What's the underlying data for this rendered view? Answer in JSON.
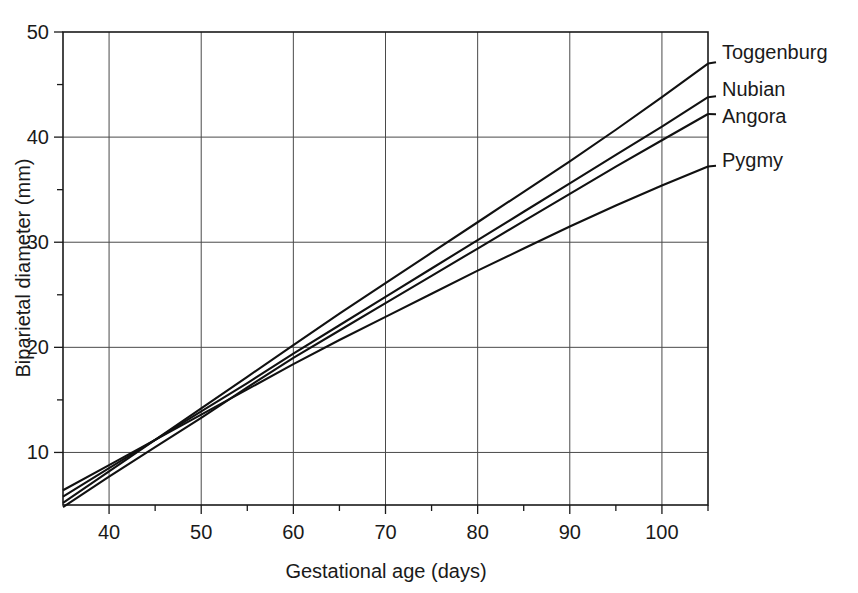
{
  "chart_data": {
    "type": "line",
    "title": "",
    "subtitle": "",
    "xlabel": "Gestational age (days)",
    "ylabel": "Biparietal diameter (mm)",
    "xlim": [
      35,
      105
    ],
    "ylim": [
      5,
      50
    ],
    "grid": true,
    "legend_position": "right-inline-labels",
    "x_major_ticks": [
      40,
      50,
      60,
      70,
      80,
      90,
      100
    ],
    "x_major_ticklabels": [
      "40",
      "50",
      "60",
      "70",
      "80",
      "90",
      "100"
    ],
    "x_minor_ticks": [
      45,
      55,
      65,
      75,
      85,
      95,
      105
    ],
    "y_major_ticks": [
      10,
      20,
      30,
      40,
      50
    ],
    "y_major_ticklabels": [
      "10",
      "20",
      "30",
      "40",
      "50"
    ],
    "y_minor_ticks": [
      15,
      25,
      35,
      45
    ],
    "x": [
      35,
      40,
      45,
      50,
      55,
      60,
      65,
      70,
      75,
      80,
      85,
      90,
      95,
      100,
      105
    ],
    "series": [
      {
        "name": "Toggenburg",
        "label": "Toggenburg",
        "color": "#111111",
        "values": [
          5.2,
          8.2,
          11.2,
          14.2,
          17.2,
          20.2,
          23.2,
          26.1,
          29.0,
          31.9,
          34.8,
          37.7,
          40.7,
          43.8,
          47.0
        ]
      },
      {
        "name": "Nubian",
        "label": "Nubian",
        "color": "#111111",
        "values": [
          5.8,
          8.5,
          11.2,
          13.9,
          16.6,
          19.4,
          22.1,
          24.8,
          27.5,
          30.2,
          32.9,
          35.6,
          38.3,
          41.0,
          43.8
        ]
      },
      {
        "name": "Angora",
        "label": "Angora",
        "color": "#111111",
        "values": [
          4.8,
          7.7,
          10.5,
          13.3,
          16.2,
          19.0,
          21.6,
          24.2,
          26.8,
          29.4,
          32.0,
          34.6,
          37.2,
          39.7,
          42.2
        ]
      },
      {
        "name": "Pygmy",
        "label": "Pygmy",
        "color": "#111111",
        "values": [
          6.4,
          8.8,
          11.2,
          13.6,
          16.0,
          18.4,
          20.7,
          22.9,
          25.1,
          27.3,
          29.4,
          31.5,
          33.5,
          35.4,
          37.2
        ]
      }
    ]
  }
}
